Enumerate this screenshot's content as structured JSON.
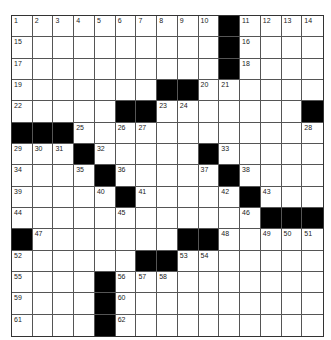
{
  "puzzle": {
    "rows": 15,
    "cols": 15,
    "colors": {
      "block": "#000000",
      "cell": "#ffffff",
      "line": "#555555"
    },
    "grid": [
      [
        "1",
        "2",
        "3",
        "4",
        "5",
        "6",
        "7",
        "8",
        "9",
        "10",
        "#",
        "11",
        "12",
        "13",
        "14"
      ],
      [
        "15",
        "",
        "",
        "",
        "",
        "",
        "",
        "",
        "",
        "",
        "#",
        "16",
        "",
        "",
        ""
      ],
      [
        "17",
        "",
        "",
        "",
        "",
        "",
        "",
        "",
        "",
        "",
        "#",
        "18",
        "",
        "",
        ""
      ],
      [
        "19",
        "",
        "",
        "",
        "",
        "",
        "",
        "#",
        "#",
        "20",
        "21",
        "",
        "",
        "",
        ""
      ],
      [
        "22",
        "",
        "",
        "",
        "",
        "#",
        "#",
        "23",
        "24",
        "",
        "",
        "",
        "",
        "",
        "#"
      ],
      [
        "#",
        "#",
        "#",
        "25",
        "",
        "26",
        "27",
        "",
        "",
        "",
        "",
        "",
        "",
        "",
        "28"
      ],
      [
        "29",
        "30",
        "31",
        "#",
        "32",
        "",
        "",
        "",
        "",
        "#",
        "33",
        "",
        "",
        "",
        ""
      ],
      [
        "34",
        "",
        "",
        "35",
        "#",
        "36",
        "",
        "",
        "",
        "37",
        "#",
        "38",
        "",
        "",
        ""
      ],
      [
        "39",
        "",
        "",
        "",
        "40",
        "#",
        "41",
        "",
        "",
        "",
        "42",
        "#",
        "43",
        "",
        ""
      ],
      [
        "44",
        "",
        "",
        "",
        "",
        "45",
        "",
        "",
        "",
        "",
        "",
        "46",
        "#",
        "#",
        "#"
      ],
      [
        "#",
        "47",
        "",
        "",
        "",
        "",
        "",
        "",
        "#",
        "#",
        "48",
        "",
        "49",
        "50",
        "51"
      ],
      [
        "52",
        "",
        "",
        "",
        "",
        "",
        "#",
        "#",
        "53",
        "54",
        "",
        "",
        "",
        "",
        ""
      ],
      [
        "55",
        "",
        "",
        "",
        "#",
        "56",
        "57",
        "58",
        "",
        "",
        "",
        "",
        "",
        "",
        ""
      ],
      [
        "59",
        "",
        "",
        "",
        "#",
        "60",
        "",
        "",
        "",
        "",
        "",
        "",
        "",
        "",
        ""
      ],
      [
        "61",
        "",
        "",
        "",
        "#",
        "62",
        "",
        "",
        "",
        "",
        "",
        "",
        "",
        "",
        ""
      ]
    ]
  }
}
